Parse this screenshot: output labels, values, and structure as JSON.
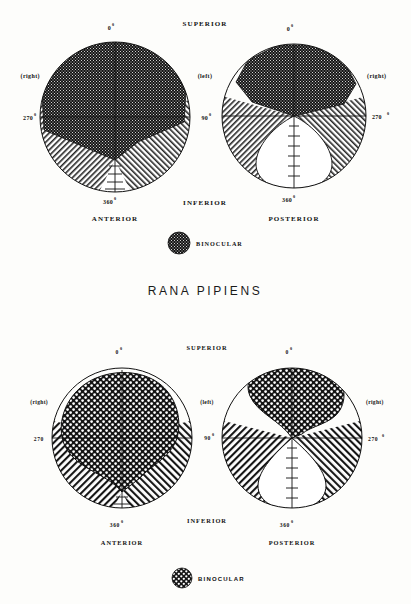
{
  "figure": {
    "species_title": "RANA PIPIENS",
    "panels": [
      {
        "id": "top",
        "diagrams": [
          {
            "id": "top-anterior",
            "view_label": "ANTERIOR",
            "deg_top": "0",
            "deg_top_sup": "0",
            "deg_left": "270",
            "deg_left_sup": "0",
            "deg_bottom": "360",
            "deg_bottom_sup": "0",
            "side_label": "(right)"
          },
          {
            "id": "top-posterior",
            "view_label": "POSTERIOR",
            "deg_top": "0",
            "deg_top_sup": "0",
            "deg_right": "270",
            "deg_right_sup": "0",
            "deg_bottom": "360",
            "deg_bottom_sup": "0",
            "side_label": "(right)"
          }
        ],
        "center_top_label": "SUPERIOR",
        "center_mid_label": "(left)",
        "center_deg": "90",
        "center_deg_sup": "0",
        "center_bottom_label": "INFERIOR",
        "legend_label": "BINOCULAR",
        "legend_pattern": "dense-dark-stipple"
      },
      {
        "id": "bottom",
        "diagrams": [
          {
            "id": "bottom-anterior",
            "view_label": "ANTERIOR",
            "deg_top": "0",
            "deg_top_sup": "0",
            "deg_left": "270",
            "deg_left_sup": "",
            "deg_bottom": "360",
            "deg_bottom_sup": "0",
            "side_label": "(right)"
          },
          {
            "id": "bottom-posterior",
            "view_label": "POSTERIOR",
            "deg_top": "0",
            "deg_top_sup": "0",
            "deg_right": "270",
            "deg_right_sup": "0",
            "deg_bottom": "360",
            "deg_bottom_sup": "0",
            "side_label": "(right)"
          }
        ],
        "center_top_label": "SUPERIOR",
        "center_mid_label": "(left)",
        "center_deg": "90",
        "center_deg_sup": "0",
        "center_bottom_label": "INFERIOR",
        "legend_label": "BINOCULAR",
        "legend_pattern": "checker-dot"
      }
    ],
    "colors": {
      "ink": "#111111",
      "paper": "#fdfdfb",
      "binocular_fill": "#1b1b1b",
      "monocular_hatch": "#2b2b2b"
    }
  }
}
